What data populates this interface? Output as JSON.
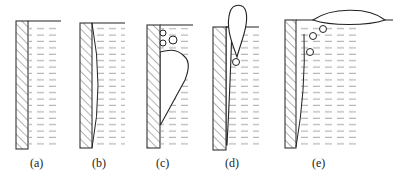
{
  "figure": {
    "panels": [
      {
        "id": "a",
        "label": "(a)"
      },
      {
        "id": "b",
        "label": "(b)"
      },
      {
        "id": "c",
        "label": "(c)"
      },
      {
        "id": "d",
        "label": "(d)"
      },
      {
        "id": "e",
        "label": "(e)"
      }
    ]
  },
  "colors": {
    "line": "#222222",
    "water_dash": "#888888",
    "hatch": "#555555",
    "background": "#ffffff"
  }
}
